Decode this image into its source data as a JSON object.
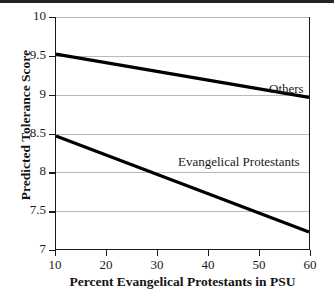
{
  "chart_data": {
    "type": "line",
    "title": "",
    "xlabel": "Percent Evangelical Protestants in PSU",
    "ylabel": "Predicted Tolerance Score",
    "xlim": [
      10,
      60
    ],
    "ylim": [
      7,
      10
    ],
    "xticks": [
      10,
      20,
      30,
      40,
      50,
      60
    ],
    "yticks": [
      7,
      7.5,
      8,
      8.5,
      9,
      9.5,
      10
    ],
    "xticklabels": [
      "10",
      "20",
      "30",
      "40",
      "50",
      "60"
    ],
    "yticklabels": [
      "7",
      "7.5",
      "8",
      "8.5",
      "9",
      "9.5",
      "10"
    ],
    "grid": "horizontal",
    "legend": "inline-annotations",
    "series": [
      {
        "name": "Others",
        "x": [
          10,
          60
        ],
        "values": [
          9.52,
          8.96
        ],
        "color": "#000000",
        "linewidth": 3.2,
        "label_position": {
          "x": 48,
          "y": 9.27
        }
      },
      {
        "name": "Evangelical Protestants",
        "x": [
          10,
          60
        ],
        "values": [
          8.46,
          7.22
        ],
        "color": "#000000",
        "linewidth": 3.2,
        "label_position": {
          "x": 27,
          "y": 8.27
        }
      }
    ]
  },
  "axes": {
    "y_title": "Predicted Tolerance Score",
    "x_title": "Percent Evangelical Protestants in PSU",
    "y_tick_labels": [
      "10",
      "9.5",
      "9",
      "8.5",
      "8",
      "7.5",
      "7"
    ],
    "x_tick_labels": [
      "10",
      "20",
      "30",
      "40",
      "50",
      "60"
    ]
  },
  "annotations": {
    "others": "Others",
    "evangelical": "Evangelical Protestants"
  },
  "colors": {
    "line": "#000000",
    "grid": "#b8b8b8",
    "axis": "#1a1a1a",
    "background": "#ffffff",
    "top_edge": "#232323"
  }
}
